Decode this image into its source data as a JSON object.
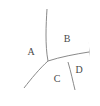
{
  "figure": {
    "kind": "partitioned-circle-diagram",
    "background_color": "#ffffff",
    "stroke_color": "#8a8a8a",
    "label_color": "#4a4a4a",
    "fill_color": "#ffffff"
  },
  "circle": {
    "center_x": 50,
    "center_y": 52,
    "radius": 39
  },
  "regions": [
    {
      "id": "A",
      "label": "A",
      "label_x": 31,
      "label_y": 53,
      "description": "largest region, left half of circle"
    },
    {
      "id": "B",
      "label": "B",
      "label_x": 67,
      "label_y": 40,
      "description": "upper right region"
    },
    {
      "id": "C",
      "label": "C",
      "label_x": 57,
      "label_y": 80,
      "description": "lower middle region"
    },
    {
      "id": "D",
      "label": "D",
      "label_x": 79,
      "label_y": 71,
      "description": "small lower right region"
    }
  ],
  "dividers": [
    {
      "id": "a-b-divider",
      "from_x": 47,
      "from_y": 9,
      "to_x": 48,
      "to_y": 61,
      "description": "arc separating A from B, top of circle to center junction"
    },
    {
      "id": "a-c-divider",
      "from_x": 48,
      "from_y": 61,
      "to_x": 24,
      "to_y": 88,
      "description": "arc separating A from C, center junction to lower left edge"
    },
    {
      "id": "b-cd-divider",
      "from_x": 48,
      "from_y": 61,
      "to_x": 89,
      "to_y": 52,
      "description": "arc separating B from C and D, center junction to right edge"
    },
    {
      "id": "c-d-divider",
      "from_x": 68,
      "from_y": 62,
      "to_x": 75,
      "to_y": 90,
      "description": "arc separating C from D, down to bottom edge"
    }
  ]
}
